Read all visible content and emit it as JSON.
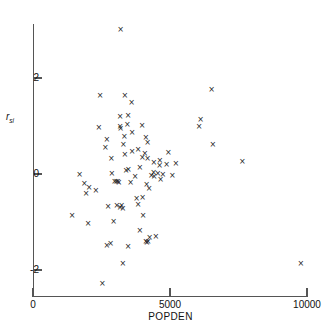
{
  "chart_data": {
    "type": "scatter",
    "title": "",
    "xlabel": "POPDEN",
    "ylabel": "r",
    "ylabel_subscript": "si",
    "xlim": [
      0,
      10000
    ],
    "ylim": [
      -2.55,
      3.25
    ],
    "xticks": [
      0,
      5000,
      10000
    ],
    "xtick_labels": [
      "0",
      "5000",
      "10000"
    ],
    "yticks": [
      2,
      0,
      -2
    ],
    "ytick_labels": [
      "2",
      "0",
      "-2"
    ],
    "grid": false,
    "legend": false,
    "marker": "x",
    "marker_glyph": "×",
    "marker_color": "#1a1a1a",
    "n_points": 82,
    "points": [
      [
        3200,
        3.02
      ],
      [
        2450,
        1.63
      ],
      [
        3350,
        1.63
      ],
      [
        3600,
        1.48
      ],
      [
        6520,
        1.76
      ],
      [
        3180,
        1.2
      ],
      [
        3470,
        1.22
      ],
      [
        3180,
        0.98
      ],
      [
        3440,
        1.03
      ],
      [
        6120,
        1.14
      ],
      [
        6060,
        0.98
      ],
      [
        2400,
        0.96
      ],
      [
        3200,
        0.95
      ],
      [
        3980,
        1.02
      ],
      [
        2700,
        0.71
      ],
      [
        3330,
        0.79
      ],
      [
        4120,
        0.77
      ],
      [
        2640,
        0.55
      ],
      [
        6560,
        0.62
      ],
      [
        3350,
        0.4
      ],
      [
        3840,
        0.52
      ],
      [
        4080,
        0.43
      ],
      [
        3990,
        0.35
      ],
      [
        4180,
        0.33
      ],
      [
        4410,
        0.25
      ],
      [
        4630,
        0.28
      ],
      [
        7640,
        0.27
      ],
      [
        2880,
        0.02
      ],
      [
        3400,
        0.07
      ],
      [
        3480,
        0.09
      ],
      [
        4400,
        0.04
      ],
      [
        4560,
        0.02
      ],
      [
        1700,
        0.0
      ],
      [
        3730,
        -0.06
      ],
      [
        4320,
        -0.04
      ],
      [
        4420,
        -0.05
      ],
      [
        2980,
        -0.15
      ],
      [
        3040,
        -0.16
      ],
      [
        3100,
        -0.15
      ],
      [
        3135,
        -0.17
      ],
      [
        4150,
        -0.22
      ],
      [
        1870,
        -0.2
      ],
      [
        2050,
        -0.28
      ],
      [
        1940,
        -0.41
      ],
      [
        3780,
        -0.52
      ],
      [
        4000,
        -0.48
      ],
      [
        2740,
        -0.68
      ],
      [
        3060,
        -0.66
      ],
      [
        3180,
        -0.7
      ],
      [
        3230,
        -0.66
      ],
      [
        3280,
        -0.72
      ],
      [
        1430,
        -0.86
      ],
      [
        2010,
        -1.04
      ],
      [
        2940,
        -0.99
      ],
      [
        3900,
        -1.18
      ],
      [
        4260,
        -1.33
      ],
      [
        4120,
        -1.41
      ],
      [
        4160,
        -1.42
      ],
      [
        4200,
        -1.4
      ],
      [
        2700,
        -1.48
      ],
      [
        2830,
        -1.44
      ],
      [
        3280,
        -1.87
      ],
      [
        9780,
        -1.87
      ],
      [
        2530,
        -2.28
      ],
      [
        3620,
        0.86
      ],
      [
        4180,
        0.66
      ],
      [
        4620,
        0.18
      ],
      [
        4880,
        0.2
      ],
      [
        4660,
        -0.12
      ],
      [
        4740,
        -0.01
      ],
      [
        3560,
        -0.18
      ],
      [
        3620,
        0.47
      ],
      [
        2290,
        -0.34
      ],
      [
        4940,
        0.44
      ],
      [
        5090,
        -0.03
      ],
      [
        5210,
        0.22
      ],
      [
        4240,
        -0.3
      ],
      [
        3840,
        -0.63
      ],
      [
        3470,
        -1.5
      ],
      [
        4480,
        -1.3
      ],
      [
        4020,
        -0.86
      ],
      [
        3300,
        0.61
      ],
      [
        2860,
        0.33
      ],
      [
        3900,
        0.13
      ]
    ]
  },
  "axes": {
    "x_origin_px": 33,
    "x_span_px": 274,
    "y_zero_px": 174,
    "y_unit_px": 48
  }
}
